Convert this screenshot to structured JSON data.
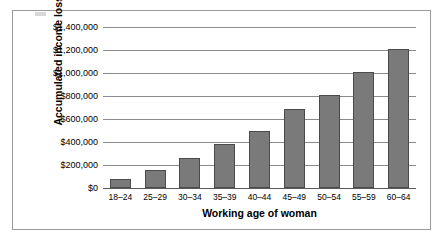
{
  "chart_data": {
    "type": "bar",
    "title": "",
    "xlabel": "Working age of woman",
    "ylabel": "Accumulated income losses",
    "categories": [
      "18–24",
      "25–29",
      "30–34",
      "35–39",
      "40–44",
      "45–49",
      "50–54",
      "55–59",
      "60–64"
    ],
    "values": [
      80000,
      160000,
      260000,
      380000,
      500000,
      690000,
      805000,
      1010000,
      1210000
    ],
    "ylim": [
      0,
      1400000
    ],
    "ytick_values": [
      0,
      200000,
      400000,
      600000,
      800000,
      1000000,
      1200000,
      1400000
    ],
    "ytick_labels": [
      "$0",
      "$200,000",
      "$400,000",
      "$600,000",
      "$800,000",
      "$1,000,000",
      "$1,200,000",
      "$1,400,000"
    ],
    "grid": true,
    "legend": false,
    "bar_color": "#7a7a7a",
    "bar_border_color": "#4a4a4a",
    "gridline_color": "#8c8c8c",
    "background_color": "#ffffff",
    "frame_color": "#9a9a9a"
  }
}
